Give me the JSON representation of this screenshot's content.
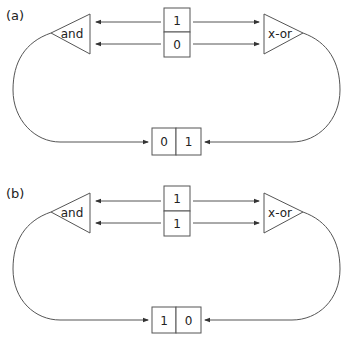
{
  "diagram": {
    "title": "",
    "line_color": "#555555",
    "text_color": "#222222",
    "panels": [
      {
        "label": "(a)",
        "left_gate": "and",
        "right_gate": "x-or",
        "input_register": {
          "top": "1",
          "bottom": "0"
        },
        "output_register": {
          "left": "0",
          "right": "1"
        }
      },
      {
        "label": "(b)",
        "left_gate": "and",
        "right_gate": "x-or",
        "input_register": {
          "top": "1",
          "bottom": "1"
        },
        "output_register": {
          "left": "1",
          "right": "0"
        }
      }
    ]
  }
}
